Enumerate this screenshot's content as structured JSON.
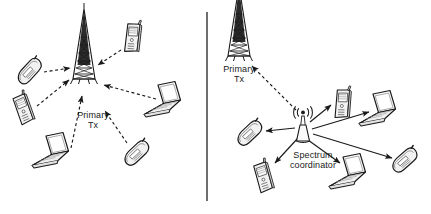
{
  "figure": {
    "width": 431,
    "height": 214,
    "background": "#ffffff",
    "stroke": "#1a1a1a",
    "divider": {
      "name": "panel-divider",
      "x": 207,
      "y1": 12,
      "y2": 201
    }
  },
  "panels": [
    {
      "id": "left",
      "name": "legacy-network-panel",
      "description": "Devices transmitting to a primary transmitter tower",
      "tower": {
        "label": "Primary\nTx",
        "x": 84,
        "y": 55
      },
      "link_style": "dashed",
      "link_direction": "inbound",
      "devices": [
        {
          "type": "phone-tilted",
          "name": "device-phone-left-upper",
          "x": 30,
          "y": 73,
          "rot": -32
        },
        {
          "type": "phone",
          "name": "device-phone-left-lower",
          "x": 22,
          "y": 110,
          "rot": -12
        },
        {
          "type": "laptop",
          "name": "device-laptop-bottom-left",
          "x": 58,
          "y": 158,
          "rot": 0
        },
        {
          "type": "phone",
          "name": "device-phone-top-right",
          "x": 131,
          "y": 38,
          "rot": 14
        },
        {
          "type": "laptop",
          "name": "device-laptop-right",
          "x": 168,
          "y": 107,
          "rot": 0
        },
        {
          "type": "phone-tilted",
          "name": "device-phone-bottom-right",
          "x": 134,
          "y": 155,
          "rot": -28
        }
      ]
    },
    {
      "id": "right",
      "name": "cognitive-radio-panel",
      "description": "Spectrum coordinator distributing spectrum to devices and linking to primary transmitter",
      "tower": {
        "label": "Primary\nTx",
        "x": 239,
        "y": 32
      },
      "coordinator": {
        "label": "Spectrum\ncoordinator",
        "x": 303,
        "y": 128,
        "icon": "radio-wave-symbol"
      },
      "primary_link_style": "dashed",
      "device_link_style": "solid",
      "link_direction": "outbound",
      "devices": [
        {
          "type": "phone-tilted",
          "name": "device-phone-coord-left",
          "x": 252,
          "y": 143,
          "rot": -28
        },
        {
          "type": "phone",
          "name": "device-phone-coord-bottom-left",
          "x": 254,
          "y": 182,
          "rot": -8
        },
        {
          "type": "phone",
          "name": "device-phone-coord-upper",
          "x": 325,
          "y": 108,
          "rot": 12
        },
        {
          "type": "laptop",
          "name": "device-laptop-coord-right",
          "x": 380,
          "y": 118,
          "rot": 0
        },
        {
          "type": "laptop",
          "name": "device-laptop-coord-bottom",
          "x": 350,
          "y": 181,
          "rot": 0
        },
        {
          "type": "phone-tilted",
          "name": "device-phone-coord-far-right",
          "x": 404,
          "y": 163,
          "rot": -26
        }
      ]
    }
  ],
  "labels": {
    "primary_tx_left": "Primary\nTx",
    "primary_tx_right": "Primary\nTx",
    "spectrum_coordinator": "Spectrum\ncoordinator"
  }
}
